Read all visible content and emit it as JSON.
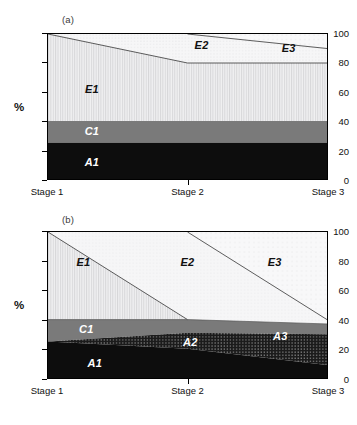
{
  "figure": {
    "panels": [
      {
        "tag": "(a)",
        "ylabel": "%",
        "yticks": [
          "0",
          "20",
          "40",
          "60",
          "80",
          "100"
        ],
        "xticks": [
          "Stage 1",
          "Stage 2",
          "Stage 3"
        ],
        "region_labels": [
          "E1",
          "C1",
          "A1",
          "E2",
          "E3"
        ]
      },
      {
        "tag": "(b)",
        "ylabel": "%",
        "yticks": [
          "0",
          "20",
          "40",
          "60",
          "80",
          "100"
        ],
        "xticks": [
          "Stage 1",
          "Stage 2",
          "Stage 3"
        ],
        "region_labels": [
          "E1",
          "C1",
          "A1",
          "E2",
          "E3",
          "A2",
          "A3"
        ]
      }
    ]
  },
  "chart_data": [
    {
      "type": "area",
      "title": "(a)",
      "subtitle": "",
      "xlabel": "",
      "ylabel": "%",
      "x": [
        "Stage 1",
        "Stage 2",
        "Stage 3"
      ],
      "xticklabels": [
        "Stage 1",
        "Stage 2",
        "Stage 3"
      ],
      "yticklabels": [
        "0",
        "20",
        "40",
        "60",
        "80",
        "100"
      ],
      "ylim": [
        0,
        100
      ],
      "ytick_step": 20,
      "grid": false,
      "legend": "none",
      "stacking": "stacked-to-100",
      "series": [
        {
          "name": "A1",
          "values": [
            25,
            25,
            25
          ],
          "fill": "#0d0d0d",
          "pattern": "solid",
          "label_color": "#ffffff"
        },
        {
          "name": "C1",
          "values": [
            15,
            15,
            15
          ],
          "fill": "#7a7a7a",
          "pattern": "solid",
          "label_color": "#ffffff"
        },
        {
          "name": "E1",
          "values": [
            60,
            40,
            40
          ],
          "fill": "#ececed",
          "pattern": "vertical-lines",
          "label_color": "#111111"
        },
        {
          "name": "E2",
          "values": [
            0,
            20,
            10
          ],
          "fill": "#f4f4f5",
          "pattern": "fine-dots",
          "label_color": "#111111"
        },
        {
          "name": "E3",
          "values": [
            0,
            0,
            10
          ],
          "fill": "#f7f7f8",
          "pattern": "sparse-dots",
          "label_color": "#111111"
        }
      ],
      "boundaries": {
        "A1_top": [
          25,
          25,
          25
        ],
        "C1_top": [
          40,
          40,
          40
        ],
        "E1_top": [
          100,
          80,
          80
        ],
        "E2_top": [
          100,
          100,
          90
        ],
        "E3_top": [
          100,
          100,
          100
        ]
      },
      "annotations": [
        {
          "text": "E1",
          "x_frac": 0.16,
          "y_value": 62
        },
        {
          "text": "C1",
          "x_frac": 0.16,
          "y_value": 33
        },
        {
          "text": "A1",
          "x_frac": 0.16,
          "y_value": 12
        },
        {
          "text": "E2",
          "x_frac": 0.55,
          "y_value": 92
        },
        {
          "text": "E3",
          "x_frac": 0.86,
          "y_value": 90
        }
      ]
    },
    {
      "type": "area",
      "title": "(b)",
      "subtitle": "",
      "xlabel": "",
      "ylabel": "%",
      "x": [
        "Stage 1",
        "Stage 2",
        "Stage 3"
      ],
      "xticklabels": [
        "Stage 1",
        "Stage 2",
        "Stage 3"
      ],
      "yticklabels": [
        "0",
        "20",
        "40",
        "60",
        "80",
        "100"
      ],
      "ylim": [
        0,
        100
      ],
      "ytick_step": 20,
      "grid": false,
      "legend": "none",
      "stacking": "stacked-to-100",
      "series": [
        {
          "name": "A1",
          "values": [
            25,
            20,
            9
          ],
          "fill": "#0d0d0d",
          "pattern": "solid",
          "label_color": "#ffffff"
        },
        {
          "name": "A2",
          "values": [
            0,
            11,
            21
          ],
          "fill": "#1c1c1c",
          "pattern": "dense-dots",
          "label_color": "#ffffff"
        },
        {
          "name": "C1",
          "values": [
            15,
            9,
            7
          ],
          "fill": "#7a7a7a",
          "pattern": "solid",
          "label_color": "#ffffff"
        },
        {
          "name": "E1",
          "values": [
            60,
            0,
            0
          ],
          "fill": "#ececed",
          "pattern": "vertical-lines",
          "label_color": "#111111"
        },
        {
          "name": "E2",
          "values": [
            0,
            60,
            0
          ],
          "fill": "#f5f5f6",
          "pattern": "fine-dots",
          "label_color": "#111111"
        },
        {
          "name": "E3",
          "values": [
            0,
            0,
            63
          ],
          "fill": "#f7f7f8",
          "pattern": "sparse-dots",
          "label_color": "#111111"
        }
      ],
      "boundaries": {
        "A1_top": [
          25,
          20,
          9
        ],
        "A2_top": [
          25,
          31,
          30
        ],
        "C1_top": [
          40,
          40,
          37
        ],
        "E1_top": [
          100,
          40,
          37
        ],
        "E2_top": [
          100,
          100,
          40
        ],
        "E3_top": [
          100,
          100,
          100
        ]
      },
      "annotations": [
        {
          "text": "E1",
          "x_frac": 0.13,
          "y_value": 79
        },
        {
          "text": "E2",
          "x_frac": 0.5,
          "y_value": 79
        },
        {
          "text": "E3",
          "x_frac": 0.81,
          "y_value": 79
        },
        {
          "text": "C1",
          "x_frac": 0.14,
          "y_value": 34
        },
        {
          "text": "A1",
          "x_frac": 0.17,
          "y_value": 11
        },
        {
          "text": "A2",
          "x_frac": 0.51,
          "y_value": 25
        },
        {
          "text": "A3",
          "x_frac": 0.83,
          "y_value": 29
        }
      ]
    }
  ]
}
